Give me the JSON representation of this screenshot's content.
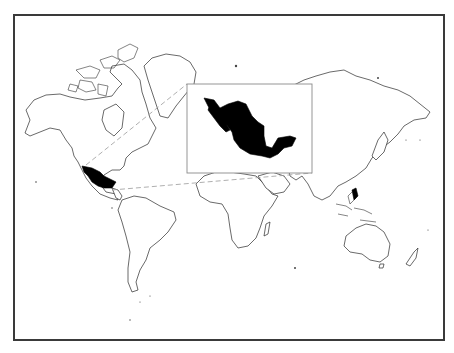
{
  "map": {
    "type": "world-locator-map",
    "projection": "mercator",
    "highlighted_region": "Mexico",
    "colors": {
      "background": "#ffffff",
      "land_fill": "#ffffff",
      "coastline": "#2a2a2a",
      "highlight": "#000000",
      "frame": "#3a3a3a",
      "leader_lines": "#9a9a9a"
    },
    "inset": {
      "subject": "Mexico",
      "style": "enlarged silhouette"
    },
    "continents": [
      "North America",
      "Greenland",
      "South America",
      "Europe",
      "Africa",
      "Asia",
      "Australia",
      "New Zealand",
      "Antarctic islands"
    ]
  }
}
